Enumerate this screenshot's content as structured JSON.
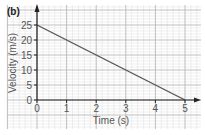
{
  "chart_data": {
    "type": "line",
    "panel_label": "(b)",
    "title": "",
    "xlabel": "Time (s)",
    "ylabel": "Velocity (m/s)",
    "xlim": [
      0,
      5
    ],
    "ylim": [
      0,
      25
    ],
    "x_ticks": [
      0,
      1,
      2,
      3,
      4,
      5
    ],
    "x_tick_labels": [
      "0",
      "1",
      "2",
      "3",
      "4",
      "5"
    ],
    "y_ticks": [
      0,
      5,
      10,
      15,
      20,
      25
    ],
    "y_tick_labels": [
      "0",
      "5",
      "10",
      "15",
      "20",
      "25"
    ],
    "grid": true,
    "minor_grid": true,
    "series": [
      {
        "name": "velocity",
        "x": [
          0,
          5
        ],
        "y": [
          25,
          0
        ],
        "color": "#555555"
      }
    ],
    "colors": {
      "major_grid": "#b0b0b0",
      "minor_grid": "#e2e2e2",
      "axis": "#222222",
      "line": "#555555"
    }
  }
}
